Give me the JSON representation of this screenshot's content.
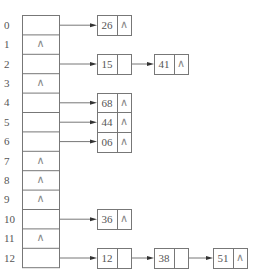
{
  "null_symbol": "∧",
  "colors": {
    "line": "#777777",
    "text": "#555555",
    "background": "#ffffff"
  },
  "table": {
    "indices": [
      "0",
      "1",
      "2",
      "3",
      "4",
      "5",
      "6",
      "7",
      "8",
      "9",
      "10",
      "11",
      "12"
    ],
    "slots": [
      {
        "index": "0",
        "null": false
      },
      {
        "index": "1",
        "null": true
      },
      {
        "index": "2",
        "null": false
      },
      {
        "index": "3",
        "null": true
      },
      {
        "index": "4",
        "null": false
      },
      {
        "index": "5",
        "null": false
      },
      {
        "index": "6",
        "null": false
      },
      {
        "index": "7",
        "null": true
      },
      {
        "index": "8",
        "null": true
      },
      {
        "index": "9",
        "null": true
      },
      {
        "index": "10",
        "null": false
      },
      {
        "index": "11",
        "null": true
      },
      {
        "index": "12",
        "null": false
      }
    ]
  },
  "chains": [
    {
      "slot": 0,
      "nodes": [
        "26"
      ]
    },
    {
      "slot": 2,
      "nodes": [
        "15",
        "41"
      ]
    },
    {
      "slot": 4,
      "nodes": [
        "68"
      ]
    },
    {
      "slot": 5,
      "nodes": [
        "44"
      ]
    },
    {
      "slot": 6,
      "nodes": [
        "06"
      ]
    },
    {
      "slot": 10,
      "nodes": [
        "36"
      ]
    },
    {
      "slot": 12,
      "nodes": [
        "12",
        "38",
        "51"
      ]
    }
  ]
}
